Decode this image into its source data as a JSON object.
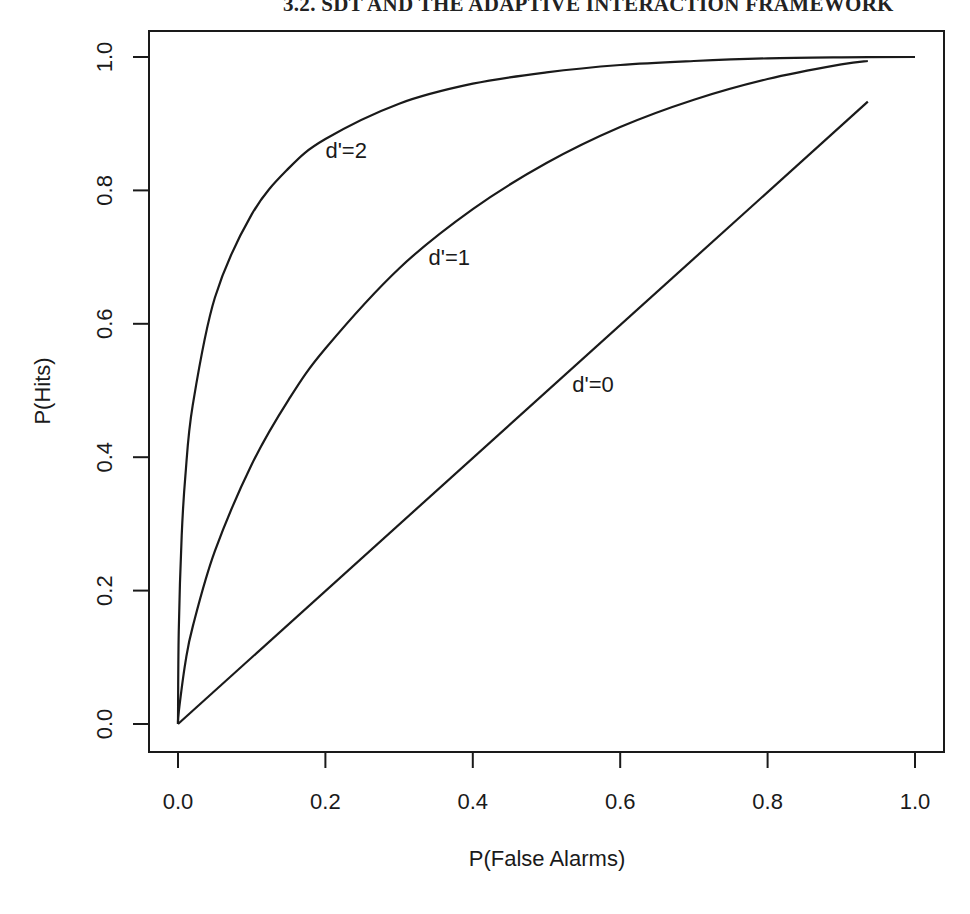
{
  "page": {
    "running_head": "3.2. SDT AND THE ADAPTIVE INTERACTION FRAMEWORK"
  },
  "chart_data": {
    "type": "line",
    "title": "",
    "xlabel": "P(False Alarms)",
    "ylabel": "P(Hits)",
    "xlim": [
      0,
      1
    ],
    "ylim": [
      0,
      1
    ],
    "grid": false,
    "legend": "none (curves labeled inline)",
    "x_ticks": [
      "0.0",
      "0.2",
      "0.4",
      "0.6",
      "0.8",
      "1.0"
    ],
    "y_ticks": [
      "0.0",
      "0.2",
      "0.4",
      "0.6",
      "0.8",
      "1.0"
    ],
    "series": [
      {
        "name": "d'=2",
        "label": "d'=2",
        "label_pos": [
          0.2,
          0.86
        ],
        "x": [
          0,
          0.001,
          0.005,
          0.01,
          0.02,
          0.05,
          0.1,
          0.15,
          0.2,
          0.3,
          0.4,
          0.5,
          0.6,
          0.7,
          0.8,
          0.9,
          1.0
        ],
        "y": [
          0,
          0.138,
          0.282,
          0.372,
          0.478,
          0.639,
          0.764,
          0.833,
          0.877,
          0.93,
          0.96,
          0.977,
          0.988,
          0.994,
          0.998,
          0.9995,
          1.0
        ]
      },
      {
        "name": "d'=1",
        "label": "d'=1",
        "label_pos": [
          0.34,
          0.7
        ],
        "x": [
          0,
          0.001,
          0.01,
          0.02,
          0.05,
          0.1,
          0.15,
          0.2,
          0.3,
          0.4,
          0.5,
          0.6,
          0.7,
          0.8,
          0.9,
          0.936
        ],
        "y": [
          0,
          0.018,
          0.092,
          0.146,
          0.259,
          0.389,
          0.486,
          0.563,
          0.683,
          0.772,
          0.841,
          0.895,
          0.936,
          0.967,
          0.989,
          0.994
        ]
      },
      {
        "name": "d'=0",
        "label": "d'=0",
        "label_pos": [
          0.535,
          0.51
        ],
        "x": [
          0,
          0.936
        ],
        "y": [
          0,
          0.933
        ]
      }
    ]
  }
}
